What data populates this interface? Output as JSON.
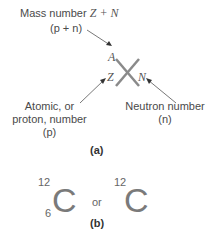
{
  "part_a": {
    "mass_label_line1": "Mass number",
    "mass_formula": "Z + N",
    "mass_label_line2": "(p + n)",
    "symbol_A": "A",
    "symbol_Z": "Z",
    "symbol_N": "N",
    "atomic_line1": "Atomic, or",
    "atomic_line2": "proton, number",
    "atomic_line3": "(p)",
    "neutron_line1": "Neutron number",
    "neutron_line2": "(n)",
    "caption": "(a)"
  },
  "part_b": {
    "left_mass": "12",
    "left_atomic": "6",
    "left_symbol": "C",
    "connector": "or",
    "right_mass": "12",
    "right_symbol": "C",
    "caption": "(b)"
  }
}
